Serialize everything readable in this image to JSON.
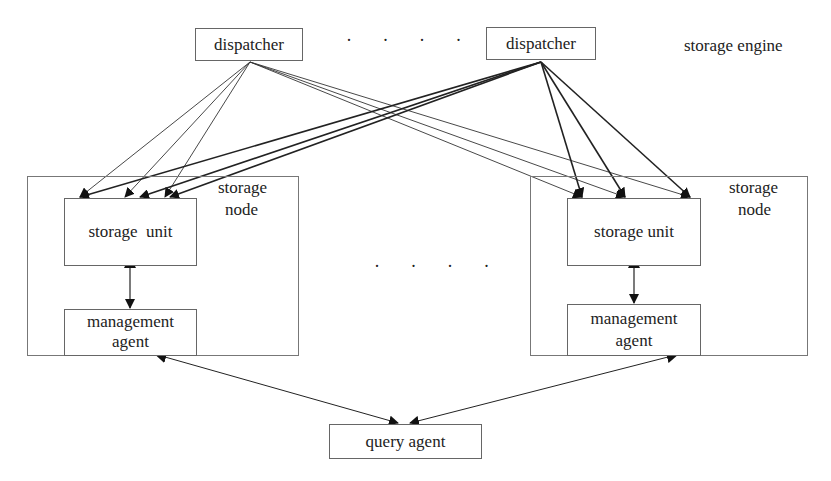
{
  "diagram": {
    "title_label": "storage engine",
    "dispatchers": [
      {
        "label": "dispatcher"
      },
      {
        "label": "dispatcher"
      }
    ],
    "dispatcher_ellipsis": "· · · ·",
    "node_ellipsis": "· · · ·",
    "storage_nodes": [
      {
        "label_line1": "storage",
        "label_line2": "node",
        "unit_label": "storage  unit",
        "agent_line1": "management",
        "agent_line2": "agent"
      },
      {
        "label_line1": "storage",
        "label_line2": "node",
        "unit_label": "storage unit",
        "agent_line1": "management",
        "agent_line2": "agent"
      }
    ],
    "query_agent": {
      "label": "query agent"
    },
    "colors": {
      "line": "#222222",
      "border": "#666666",
      "background": "#ffffff"
    }
  }
}
